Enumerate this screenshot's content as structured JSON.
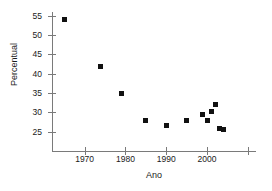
{
  "chart_data": {
    "type": "scatter",
    "title": "",
    "xlabel": "Ano",
    "ylabel": "Percentual",
    "xlim": [
      1962,
      2012
    ],
    "ylim": [
      20,
      56
    ],
    "grid": false,
    "legend": null,
    "x_ticks": [
      {
        "value": 1970,
        "label": "1970"
      },
      {
        "value": 1980,
        "label": "1980"
      },
      {
        "value": 1990,
        "label": "1990"
      },
      {
        "value": 2000,
        "label": "2000"
      },
      {
        "value": 2010,
        "label": ""
      }
    ],
    "y_ticks": [
      {
        "value": 25,
        "label": "25"
      },
      {
        "value": 30,
        "label": "30"
      },
      {
        "value": 35,
        "label": "35"
      },
      {
        "value": 40,
        "label": "40"
      },
      {
        "value": 45,
        "label": "45"
      },
      {
        "value": 50,
        "label": "50"
      },
      {
        "value": 55,
        "label": "55"
      }
    ],
    "marker": {
      "shape": "square",
      "color": "#111111",
      "size": 5
    },
    "axis_color": "#7a7a7a",
    "background_color": "#ffffff",
    "x": [
      1965,
      1974,
      1979,
      1985,
      1990,
      1995,
      1999,
      2000,
      2001,
      2002,
      2003,
      2004
    ],
    "y": [
      54,
      42,
      34.8,
      28,
      26.5,
      27.8,
      29.5,
      28,
      30.3,
      32,
      25.8,
      25.6
    ],
    "points": [
      {
        "x": 1965,
        "y": 54
      },
      {
        "x": 1974,
        "y": 42
      },
      {
        "x": 1979,
        "y": 34.8
      },
      {
        "x": 1985,
        "y": 28
      },
      {
        "x": 1990,
        "y": 26.5
      },
      {
        "x": 1995,
        "y": 27.8
      },
      {
        "x": 1999,
        "y": 29.5
      },
      {
        "x": 2000,
        "y": 28
      },
      {
        "x": 2001,
        "y": 30.3
      },
      {
        "x": 2002,
        "y": 32
      },
      {
        "x": 2003,
        "y": 25.8
      },
      {
        "x": 2004,
        "y": 25.6
      }
    ]
  }
}
